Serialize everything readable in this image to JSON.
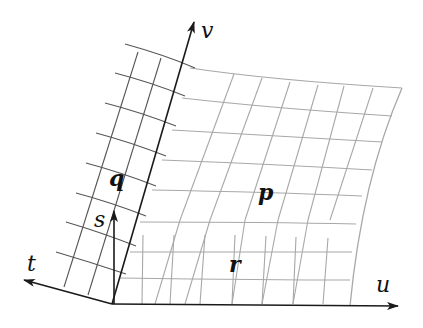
{
  "diagram": {
    "type": "coordinate-surface-grid",
    "colors": {
      "background": "#ffffff",
      "axis": "#1a1a1a",
      "dark_grid": "#555555",
      "light_grid": "#a8a8a8",
      "label": "#111111"
    },
    "axes": [
      {
        "id": "u",
        "label": "u"
      },
      {
        "id": "v",
        "label": "v"
      },
      {
        "id": "s",
        "label": "s"
      },
      {
        "id": "t",
        "label": "t"
      }
    ],
    "regions": [
      {
        "id": "p",
        "label": "p"
      },
      {
        "id": "q",
        "label": "q"
      },
      {
        "id": "r",
        "label": "r"
      }
    ]
  }
}
